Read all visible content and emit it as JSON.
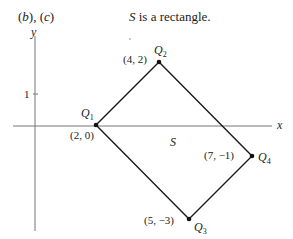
{
  "figure": {
    "part_label": "(b), (c)",
    "part_label_parts": [
      "(",
      "b",
      "), (",
      "c",
      ")"
    ],
    "statement": "S is a rectangle.",
    "statement_var": "S",
    "statement_rest": " is a rectangle.",
    "axes": {
      "x_label": "x",
      "y_label": "y",
      "y_tick_label": "1"
    },
    "region_label": "S",
    "points": [
      {
        "name": "Q",
        "sub": "1",
        "coord": "(2, 0)"
      },
      {
        "name": "Q",
        "sub": "2",
        "coord": "(4, 2)"
      },
      {
        "name": "Q",
        "sub": "3",
        "coord": "(5, −3)"
      },
      {
        "name": "Q",
        "sub": "4",
        "coord": "(7, −1)"
      }
    ],
    "colors": {
      "line": "#1a1a1a",
      "axis": "#666666",
      "text": "#222222"
    }
  }
}
